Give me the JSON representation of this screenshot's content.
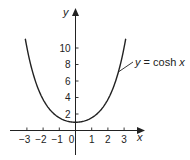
{
  "chart_data": {
    "type": "line",
    "title": "",
    "xlabel": "x",
    "ylabel": "y",
    "xlim": [
      -3.1,
      3.1
    ],
    "ylim": [
      0,
      11.6
    ],
    "x_ticks": [
      -3,
      -2,
      -1,
      0,
      1,
      2,
      3
    ],
    "x_tick_labels": [
      "−3",
      "−2",
      "−1",
      "0",
      "1",
      "2",
      "3"
    ],
    "y_ticks": [
      2,
      4,
      6,
      8,
      10
    ],
    "y_tick_labels": [
      "2",
      "4",
      "6",
      "8",
      "10"
    ],
    "grid": false,
    "series": [
      {
        "name": "y = cosh x",
        "function": "cosh",
        "x": [
          -3.1,
          -3,
          -2.5,
          -2,
          -1.5,
          -1,
          -0.5,
          0,
          0.5,
          1,
          1.5,
          2,
          2.5,
          3,
          3.1
        ],
        "values": [
          11.13,
          10.07,
          6.13,
          3.76,
          2.35,
          1.54,
          1.13,
          1.0,
          1.13,
          1.54,
          2.35,
          3.76,
          6.13,
          10.07,
          11.13
        ]
      }
    ],
    "annotations": [
      {
        "text_prefix": "y",
        "text_eq": " = cosh ",
        "text_var": "x",
        "points_to_x": 2.65,
        "points_to_y": 7.1
      }
    ]
  }
}
